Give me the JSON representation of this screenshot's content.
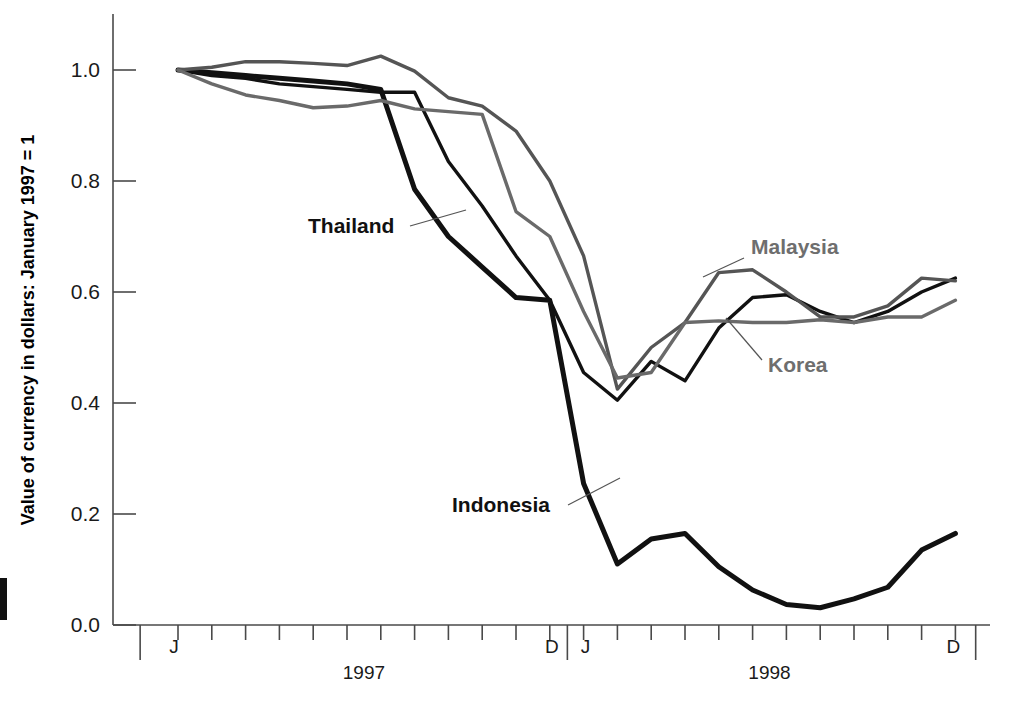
{
  "figure": {
    "background": "#ffffff",
    "y_axis_title": "Value of currency in dollars: January 1997 = 1",
    "year_labels": [
      "1997",
      "1998"
    ],
    "month_start_label": "J",
    "month_end_label": "D"
  },
  "series_labels": [
    {
      "name": "Thailand",
      "color": "#111111",
      "x": 308,
      "y": 233,
      "anchor": "start",
      "leader": "M 410 226 L 466 210"
    },
    {
      "name": "Indonesia",
      "color": "#111111",
      "x": 452,
      "y": 512,
      "anchor": "start",
      "leader": "M 568 505 L 620 478"
    },
    {
      "name": "Malaysia",
      "color": "#6e6e6e",
      "x": 751,
      "y": 254,
      "anchor": "start",
      "leader": "M 744 258 L 703 277"
    },
    {
      "name": "Korea",
      "color": "#6e6e6e",
      "x": 768,
      "y": 372,
      "anchor": "start",
      "leader": "M 762 360 L 726 318"
    }
  ],
  "chart_data": {
    "type": "line",
    "title": "",
    "xlabel": "",
    "ylabel": "Value of currency in dollars: January 1997 = 1",
    "ylim": [
      0.0,
      1.05
    ],
    "yticks": [
      "0.0",
      "0.2",
      "0.4",
      "0.6",
      "0.8",
      "1.0"
    ],
    "ytick_values": [
      0.0,
      0.2,
      0.4,
      0.6,
      0.8,
      1.0
    ],
    "grid": false,
    "legend": "inline-annotations",
    "x": [
      "1997-01",
      "1997-02",
      "1997-03",
      "1997-04",
      "1997-05",
      "1997-06",
      "1997-07",
      "1997-08",
      "1997-09",
      "1997-10",
      "1997-11",
      "1997-12",
      "1998-01",
      "1998-02",
      "1998-03",
      "1998-04",
      "1998-05",
      "1998-06",
      "1998-07",
      "1998-08",
      "1998-09",
      "1998-10",
      "1998-11",
      "1998-12"
    ],
    "xtick_labels": [
      "J",
      "",
      "",
      "",
      "",
      "",
      "",
      "",
      "",
      "",
      "",
      "D",
      "J",
      "",
      "",
      "",
      "",
      "",
      "",
      "",
      "",
      "",
      "",
      "D"
    ],
    "x_group_labels": [
      {
        "label": "1997",
        "from": "1997-01",
        "to": "1997-12"
      },
      {
        "label": "1998",
        "from": "1998-01",
        "to": "1998-12"
      }
    ],
    "series": [
      {
        "name": "Thailand",
        "color": "#111111",
        "width": 3.4,
        "values": [
          1.0,
          0.99,
          0.985,
          0.975,
          0.97,
          0.965,
          0.96,
          0.96,
          0.835,
          0.755,
          0.665,
          0.585,
          0.455,
          0.405,
          0.475,
          0.44,
          0.535,
          0.59,
          0.595,
          0.565,
          0.545,
          0.565,
          0.6,
          0.625
        ]
      },
      {
        "name": "Indonesia",
        "color": "#111111",
        "width": 5.0,
        "values": [
          1.0,
          0.995,
          0.99,
          0.985,
          0.98,
          0.975,
          0.965,
          0.785,
          0.7,
          0.645,
          0.59,
          0.585,
          0.255,
          0.11,
          0.155,
          0.165,
          0.105,
          0.063,
          0.037,
          0.031,
          0.047,
          0.068,
          0.135,
          0.165
        ]
      },
      {
        "name": "Malaysia",
        "color": "#555555",
        "width": 3.4,
        "values": [
          1.0,
          1.005,
          1.015,
          1.015,
          1.012,
          1.008,
          1.025,
          0.998,
          0.95,
          0.935,
          0.89,
          0.8,
          0.665,
          0.425,
          0.5,
          0.545,
          0.635,
          0.64,
          0.6,
          0.555,
          0.555,
          0.575,
          0.625,
          0.62
        ]
      },
      {
        "name": "Korea",
        "color": "#6a6a6a",
        "width": 3.4,
        "values": [
          1.0,
          0.975,
          0.955,
          0.945,
          0.932,
          0.935,
          0.945,
          0.93,
          0.925,
          0.92,
          0.745,
          0.7,
          0.565,
          0.445,
          0.455,
          0.545,
          0.548,
          0.545,
          0.545,
          0.55,
          0.545,
          0.555,
          0.555,
          0.585
        ]
      }
    ]
  }
}
